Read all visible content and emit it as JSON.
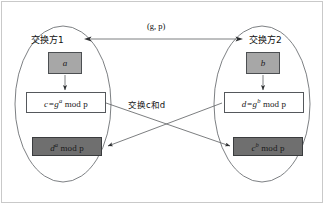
{
  "figure": {
    "background_color": "#ffffff",
    "frame_color": "#c9c9c9",
    "line_color": "#5a5d60"
  },
  "parties": {
    "left": {
      "label": "交换方1",
      "secret_box": {
        "text": "a",
        "fill": "#a7a7a7"
      },
      "public_box": {
        "text": "c=gᵃ mod p",
        "base": "c=g",
        "exponent": "a",
        "suffix": " mod p",
        "fill": "#ffffff"
      },
      "shared_box": {
        "text": "dᵃ mod p",
        "base": "d",
        "exponent": "a",
        "suffix": " mod p",
        "fill": "#6f6f6f"
      }
    },
    "right": {
      "label": "交换方2",
      "secret_box": {
        "text": "b",
        "fill": "#a7a7a7"
      },
      "public_box": {
        "text": "d=gᵇ mod p",
        "base": "d=g",
        "exponent": "b",
        "suffix": " mod p",
        "fill": "#ffffff"
      },
      "shared_box": {
        "text": "cᵇ mod p",
        "base": "c",
        "exponent": "b",
        "suffix": " mod p",
        "fill": "#6f6f6f"
      }
    }
  },
  "edges": {
    "top_label": "(g, p)",
    "middle_label": "交换c和d",
    "middle_label_parts": {
      "prefix": "交换",
      "first": "c",
      "joiner": "和",
      "second": "d"
    }
  }
}
